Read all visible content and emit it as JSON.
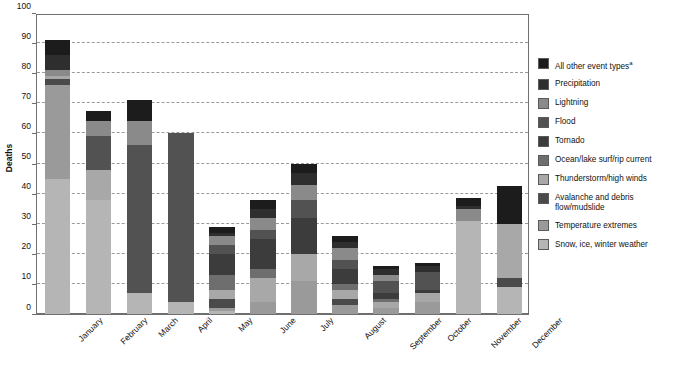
{
  "chart_data": {
    "type": "bar",
    "subtype": "stacked-bar",
    "title": "",
    "xlabel": "",
    "ylabel": "Deaths",
    "ylim": [
      0,
      100
    ],
    "ytick_step": 10,
    "yticks": [
      0,
      10,
      20,
      30,
      40,
      50,
      60,
      70,
      80,
      90,
      100
    ],
    "grid": "horizontal-dashed",
    "legend_position": "right",
    "categories": [
      "January",
      "February",
      "March",
      "April",
      "May",
      "June",
      "July",
      "August",
      "September",
      "October",
      "November",
      "December"
    ],
    "series": [
      {
        "name": "Snow, ice, winter weather",
        "color": "#b5b5b5",
        "values": [
          45,
          38,
          7,
          4,
          1,
          0,
          0,
          0,
          0,
          0,
          31,
          9
        ]
      },
      {
        "name": "Temperature extremes",
        "color": "#9a9a9a",
        "values": [
          31,
          0,
          0,
          0,
          1,
          4,
          11,
          3,
          2,
          4,
          0,
          0
        ]
      },
      {
        "name": "Avalanche and debris flow/mudslide",
        "color": "#4a4a4a",
        "values": [
          2,
          0,
          0,
          0,
          3,
          0,
          0,
          2,
          0,
          0,
          0,
          3
        ]
      },
      {
        "name": "Thunderstorm/high winds",
        "color": "#a8a8a8",
        "values": [
          1,
          10,
          0,
          0,
          3,
          8,
          9,
          3,
          2,
          3,
          0,
          18
        ]
      },
      {
        "name": "Ocean/lake surf/rip current",
        "color": "#6e6e6e",
        "values": [
          0,
          0,
          0,
          0,
          5,
          3,
          0,
          2,
          1,
          0,
          0,
          0
        ]
      },
      {
        "name": "Tornado",
        "color": "#3c3c3c",
        "values": [
          0,
          0,
          0,
          0,
          7,
          10,
          12,
          5,
          2,
          1,
          0,
          0
        ]
      },
      {
        "name": "Flood",
        "color": "#525252",
        "values": [
          0,
          11,
          49,
          56,
          3,
          3,
          6,
          3,
          4,
          6,
          0,
          0
        ]
      },
      {
        "name": "Lightning",
        "color": "#8a8a8a",
        "values": [
          2,
          5,
          8,
          0,
          3,
          4,
          5,
          4,
          2,
          0,
          4,
          0
        ]
      },
      {
        "name": "Precipitation",
        "color": "#2e2e2e",
        "values": [
          5,
          0,
          0,
          0,
          1,
          3,
          4,
          2,
          2,
          2,
          1,
          0
        ]
      },
      {
        "name": "All other event types",
        "color": "#1c1c1c",
        "values": [
          5,
          3.5,
          7,
          0,
          2,
          3,
          3,
          2,
          1,
          1,
          2.5,
          12.5
        ]
      }
    ],
    "totals": [
      91,
      67.5,
      71,
      60,
      29,
      38,
      50,
      26,
      16,
      17,
      38.5,
      42.5
    ]
  },
  "yaxis": {
    "title": "Deaths",
    "ticks": [
      "100",
      "90",
      "80",
      "70",
      "60",
      "50",
      "40",
      "30",
      "20",
      "10",
      "0"
    ]
  },
  "xaxis": {
    "labels": [
      "January",
      "February",
      "March",
      "April",
      "May",
      "June",
      "July",
      "August",
      "September",
      "October",
      "November",
      "December"
    ]
  },
  "legend": {
    "items": [
      {
        "label": "All other event types",
        "footnote": "a",
        "color": "#1c1c1c"
      },
      {
        "label": "Precipitation",
        "footnote": "",
        "color": "#2e2e2e"
      },
      {
        "label": "Lightning",
        "footnote": "",
        "color": "#8a8a8a"
      },
      {
        "label": "Flood",
        "footnote": "",
        "color": "#525252"
      },
      {
        "label": "Tornado",
        "footnote": "",
        "color": "#3c3c3c"
      },
      {
        "label": "Ocean/lake surf/rip current",
        "footnote": "",
        "color": "#6e6e6e"
      },
      {
        "label": "Thunderstorm/high winds",
        "footnote": "",
        "color": "#a8a8a8"
      },
      {
        "label": "Avalanche and debris flow/mudslide",
        "footnote": "",
        "color": "#4a4a4a"
      },
      {
        "label": "Temperature extremes",
        "footnote": "",
        "color": "#9a9a9a"
      },
      {
        "label": "Snow, ice, winter weather",
        "footnote": "",
        "color": "#b5b5b5"
      }
    ]
  }
}
